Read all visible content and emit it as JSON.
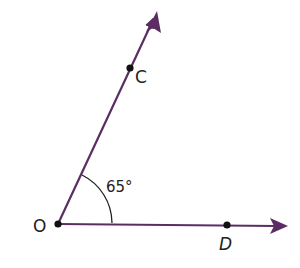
{
  "diagram": {
    "type": "angle",
    "colors": {
      "ray": "#5a2e63",
      "point": "#111111",
      "arc": "#222222",
      "text": "#222222",
      "background": "#ffffff"
    },
    "vertex": {
      "label": "O",
      "x": 58,
      "y": 224
    },
    "rays": [
      {
        "name": "OC",
        "from": [
          58,
          224
        ],
        "to": [
          157,
          12
        ]
      },
      {
        "name": "OD",
        "from": [
          58,
          224
        ],
        "to": [
          288,
          226
        ]
      }
    ],
    "points": [
      {
        "label": "O",
        "x": 58,
        "y": 224
      },
      {
        "label": "C",
        "x": 130,
        "y": 68
      },
      {
        "label": "D",
        "x": 227,
        "y": 225
      }
    ],
    "angle": {
      "label": "65°",
      "value_degrees": 65,
      "between": [
        "OC",
        "OD"
      ]
    }
  }
}
